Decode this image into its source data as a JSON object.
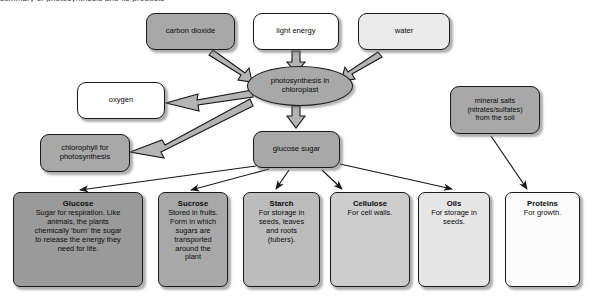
{
  "diagram": {
    "title_cropped": "summary of photosynthesis and its products",
    "palette": {
      "outline": "#1a1a1a",
      "arrow_fill": "#b4b4b4",
      "arrow_line": "#1a1a1a",
      "shadow": "#6e6e6e",
      "shade_dark": "#8e8e8e",
      "shade_mid_dark": "#9a9a9a",
      "shade_mid": "#a8a8a8",
      "shade_light": "#c9c9c9",
      "shade_lighter": "#e0e0e0",
      "shade_pale": "#efefef",
      "white": "#ffffff"
    },
    "nodes": {
      "carbon_dioxide": {
        "label": "carbon dioxide",
        "fill": "#a8a8a8"
      },
      "light_energy": {
        "label": "light energy",
        "fill": "#ffffff"
      },
      "water": {
        "label": "water",
        "fill": "#eaeaea"
      },
      "photosynthesis": {
        "label": "photosynthesis in\nchloroplast",
        "fill": "#a8a8a8"
      },
      "oxygen": {
        "label": "oxygen",
        "fill": "#ffffff"
      },
      "chlorophyll": {
        "label": "chlorophyll for\nphotosynthesis",
        "fill": "#a8a8a8"
      },
      "glucose_sugar": {
        "label": "glucose sugar",
        "fill": "#a8a8a8"
      },
      "mineral_salts": {
        "label": "mineral salts\n(nitrates/sulfates)\nfrom the soil",
        "fill": "#a8a8a8"
      }
    },
    "products": [
      {
        "name": "Glucose",
        "desc": "Sugar for respiration. Like\nanimals, the plants\nchemically 'burn' the sugar\nto release the energy they\nneed for life.",
        "fill": "#9a9a9a"
      },
      {
        "name": "Sucrose",
        "desc": "Stored in fruits.\nForm in which\nsugars are\ntransported\naround the\nplant",
        "fill": "#a8a8a8"
      },
      {
        "name": "Starch",
        "desc": "For storage in\nseeds, leaves\nand roots\n(tubers).",
        "fill": "#bcbcbc"
      },
      {
        "name": "Cellulose",
        "desc": "For cell walls.",
        "fill": "#cdcdcd"
      },
      {
        "name": "Oils",
        "desc": "For storage in\nseeds.",
        "fill": "#e6e6e6"
      },
      {
        "name": "Proteins",
        "desc": "For growth.",
        "fill": "#fbfbfb"
      }
    ],
    "edges": [
      {
        "from": "carbon_dioxide",
        "to": "photosynthesis",
        "style": "outlined-block-arrow"
      },
      {
        "from": "light_energy",
        "to": "photosynthesis",
        "style": "outlined-block-arrow"
      },
      {
        "from": "water",
        "to": "photosynthesis",
        "style": "outlined-block-arrow"
      },
      {
        "from": "photosynthesis",
        "to": "oxygen",
        "style": "outlined-block-arrow"
      },
      {
        "from": "photosynthesis",
        "to": "chlorophyll",
        "style": "outlined-block-arrow"
      },
      {
        "from": "photosynthesis",
        "to": "glucose_sugar",
        "style": "outlined-block-arrow"
      },
      {
        "from": "glucose_sugar",
        "to": "Glucose",
        "style": "thin-line-arrow"
      },
      {
        "from": "glucose_sugar",
        "to": "Sucrose",
        "style": "thin-line-arrow"
      },
      {
        "from": "glucose_sugar",
        "to": "Starch",
        "style": "thin-line-arrow"
      },
      {
        "from": "glucose_sugar",
        "to": "Cellulose",
        "style": "thin-line-arrow"
      },
      {
        "from": "glucose_sugar",
        "to": "Oils",
        "style": "thin-line-arrow"
      },
      {
        "from": "mineral_salts",
        "to": "Proteins",
        "style": "thin-line-arrow"
      }
    ]
  }
}
